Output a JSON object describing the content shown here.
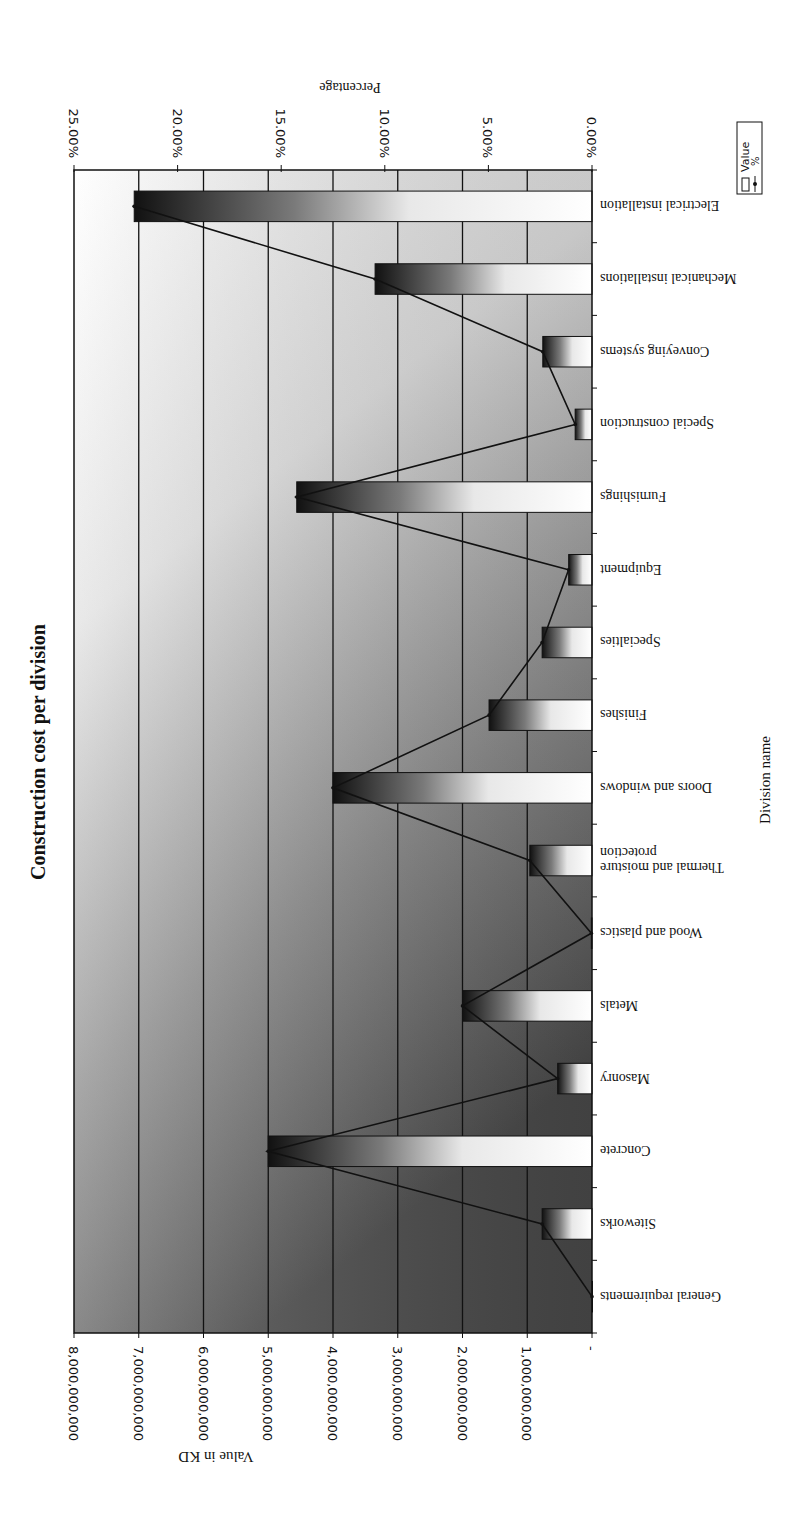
{
  "page": {
    "orientation_note": "Chart image is rotated 180 degrees; bars extend leftward from baseline at right edge"
  },
  "chart_data": {
    "type": "bar",
    "title": "Construction cost per division",
    "xlabel": "Division name",
    "ylabel": "Value in KD",
    "y2label": "Percentage",
    "ylim": [
      0,
      8000000000
    ],
    "y2lim": [
      0,
      25
    ],
    "grid": true,
    "legend_position": "right",
    "categories": [
      "General requirements",
      "Siteworks",
      "Concrete",
      "Masonry",
      "Metals",
      "Wood and plastics",
      "Thermal and moisture protection",
      "Doors and windows",
      "Finishes",
      "Specialties",
      "Equipment",
      "Furnishings",
      "Special construction",
      "Conveying systems",
      "Mechanical installations",
      "Electrical installation"
    ],
    "category_label_lines": [
      [
        "General requirements"
      ],
      [
        "Siteworks"
      ],
      [
        "Concrete"
      ],
      [
        "Masonry"
      ],
      [
        "Metals"
      ],
      [
        "Wood and plastics"
      ],
      [
        "Thermal and moisture",
        "protection"
      ],
      [
        "Doors and windows"
      ],
      [
        "Finishes"
      ],
      [
        "Specialties"
      ],
      [
        "Equipment"
      ],
      [
        "Furnishings"
      ],
      [
        "Special construction"
      ],
      [
        "Conveying systems"
      ],
      [
        "Mechanical installations"
      ],
      [
        "Electrical installation"
      ]
    ],
    "series": [
      {
        "name": "Value",
        "type": "bar",
        "axis": "primary",
        "values": [
          0,
          770000000,
          5000000000,
          530000000,
          2000000000,
          10000000,
          960000000,
          4000000000,
          1590000000,
          770000000,
          360000000,
          4560000000,
          260000000,
          760000000,
          3350000000,
          7070000000
        ]
      },
      {
        "name": "%",
        "type": "line",
        "axis": "secondary",
        "values": [
          0.0,
          2.41,
          15.63,
          1.66,
          6.25,
          0.03,
          3.0,
          12.5,
          4.97,
          2.41,
          1.13,
          14.25,
          0.81,
          2.38,
          10.47,
          22.1
        ]
      }
    ],
    "y_ticks": [
      "-",
      "1,000,000,000",
      "2,000,000,000",
      "3,000,000,000",
      "4,000,000,000",
      "5,000,000,000",
      "6,000,000,000",
      "7,000,000,000",
      "8,000,000,000"
    ],
    "y2_ticks": [
      "0.00%",
      "5.00%",
      "10.00%",
      "15.00%",
      "20.00%",
      "25.00%"
    ],
    "legend": [
      {
        "label": "Value",
        "symbol": "bar"
      },
      {
        "label": "%",
        "symbol": "line-marker"
      }
    ],
    "colors": {
      "bar_dark": "#111111",
      "bar_mid": "#8a8a8a",
      "bar_light": "#ffffff",
      "line": "#111111",
      "grid": "#111111",
      "bg_light": "#ffffff",
      "bg_dark": "#4a4a4a"
    }
  }
}
